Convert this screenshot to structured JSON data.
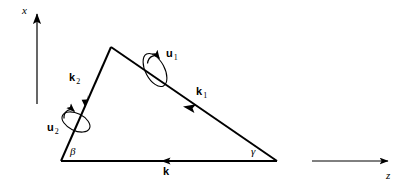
{
  "figure": {
    "kind": "vector-triangle-diagram",
    "background": "#ffffff",
    "stroke": "#000000",
    "width": 407,
    "height": 188
  },
  "axes": {
    "x": {
      "label": "x",
      "orientation": "vertical-up",
      "tip": [
        37,
        10
      ],
      "tail": [
        37,
        104
      ]
    },
    "z": {
      "label": "z",
      "orientation": "horizontal-right",
      "tail": [
        312,
        161
      ],
      "tip": [
        392,
        161
      ]
    }
  },
  "triangle": {
    "vertices": {
      "left": [
        61,
        161
      ],
      "apex": [
        111,
        47
      ],
      "right": [
        277,
        161
      ]
    }
  },
  "vectors": [
    {
      "name": "k",
      "label": "k",
      "subscript": "",
      "side": "base",
      "direction": "leftward",
      "label_pos": [
        165,
        168
      ]
    },
    {
      "name": "k1",
      "label": "k",
      "subscript": "1",
      "side": "hypotenuse",
      "direction": "up-left",
      "label_pos": [
        199,
        90
      ]
    },
    {
      "name": "k2",
      "label": "k",
      "subscript": "2",
      "side": "left-edge",
      "direction": "down-left",
      "label_pos": [
        72,
        76
      ]
    }
  ],
  "rotation_axes": [
    {
      "name": "u1",
      "label": "u",
      "subscript": "1",
      "about": "k1",
      "center": [
        155,
        70
      ],
      "label_pos": [
        168,
        52
      ]
    },
    {
      "name": "u2",
      "label": "u",
      "subscript": "2",
      "about": "k2",
      "center": [
        76,
        122
      ],
      "label_pos": [
        50,
        126
      ]
    }
  ],
  "angles": [
    {
      "name": "beta",
      "label": "β",
      "at_vertex": "left",
      "label_pos": [
        70,
        146
      ]
    },
    {
      "name": "gamma",
      "label": "γ",
      "at_vertex": "right",
      "label_pos": [
        251,
        146
      ]
    }
  ]
}
